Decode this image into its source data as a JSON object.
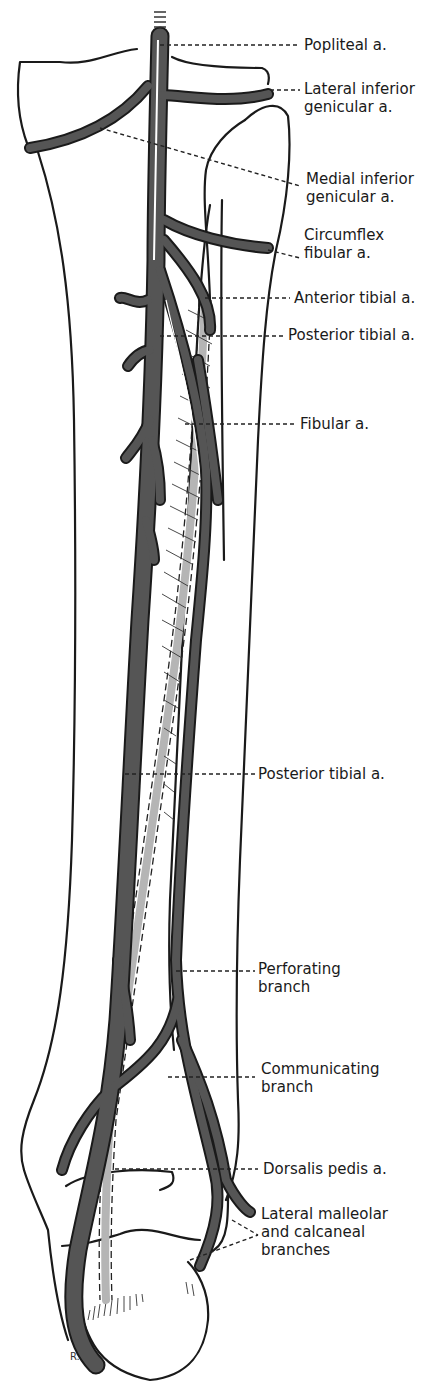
{
  "figure": {
    "artist_initials": "R.Y.",
    "colors": {
      "artery_fill": "#555555",
      "artery_outline": "#1a1a1a",
      "anterior_tibial_fill": "#b5b5b5",
      "bone_outline": "#1a1a1a",
      "background": "#ffffff"
    }
  },
  "labels": [
    {
      "id": "popliteal",
      "lines": [
        "Popliteal a."
      ]
    },
    {
      "id": "lateral-inferior-genicular",
      "lines": [
        "Lateral inferior",
        "genicular a."
      ]
    },
    {
      "id": "medial-inferior-genicular",
      "lines": [
        "Medial inferior",
        "genicular a."
      ]
    },
    {
      "id": "circumflex-fibular",
      "lines": [
        "Circumflex",
        "fibular a."
      ]
    },
    {
      "id": "anterior-tibial",
      "lines": [
        "Anterior tibial a."
      ]
    },
    {
      "id": "posterior-tibial-upper",
      "lines": [
        "Posterior tibial a."
      ]
    },
    {
      "id": "fibular",
      "lines": [
        "Fibular a."
      ]
    },
    {
      "id": "posterior-tibial-lower",
      "lines": [
        "Posterior tibial a."
      ]
    },
    {
      "id": "perforating-branch",
      "lines": [
        "Perforating",
        "branch"
      ]
    },
    {
      "id": "communicating-branch",
      "lines": [
        "Communicating",
        "branch"
      ]
    },
    {
      "id": "dorsalis-pedis",
      "lines": [
        "Dorsalis pedis a."
      ]
    },
    {
      "id": "lateral-malleolar-calcaneal",
      "lines": [
        "Lateral malleolar",
        "and calcaneal",
        "branches"
      ]
    }
  ]
}
